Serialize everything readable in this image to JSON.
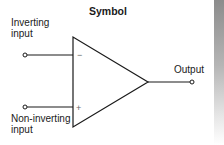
{
  "diagram": {
    "title": "Symbol",
    "component": "operational amplifier",
    "inputs": [
      {
        "label_line1": "Inverting",
        "label_line2": "input",
        "sign": "−"
      },
      {
        "label_line1": "Non-inverting",
        "label_line2": "input",
        "sign": "+"
      }
    ],
    "output": {
      "label": "Output"
    },
    "colors": {
      "stroke": "#1a1a1a",
      "sign": "#666666",
      "side_bar": "#8c8c8c"
    }
  }
}
